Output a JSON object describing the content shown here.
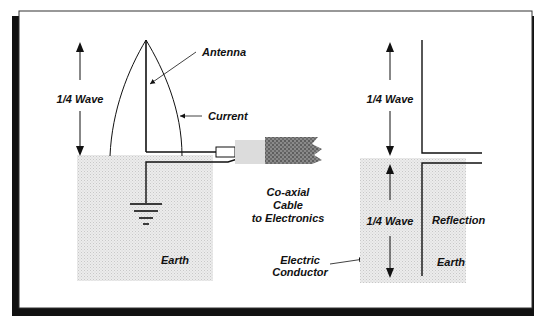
{
  "diagram": {
    "left": {
      "wave_label": "1/4 Wave",
      "antenna_label": "Antenna",
      "current_label": "Current",
      "earth_label": "Earth"
    },
    "center": {
      "cable_label_lines": [
        "Co-axial",
        "Cable",
        "to Electronics"
      ],
      "conductor_label_lines": [
        "Electric",
        "Conductor"
      ]
    },
    "right": {
      "upper_wave_label": "1/4 Wave",
      "lower_wave_label": "1/4 Wave",
      "reflection_label": "Reflection",
      "earth_label": "Earth"
    }
  },
  "colors": {
    "ink": "#111111",
    "earth_fill": "#e6e6e6",
    "cable_fill": "#7a7a7a",
    "shadow": "#111111",
    "frame": "#ffffff"
  }
}
